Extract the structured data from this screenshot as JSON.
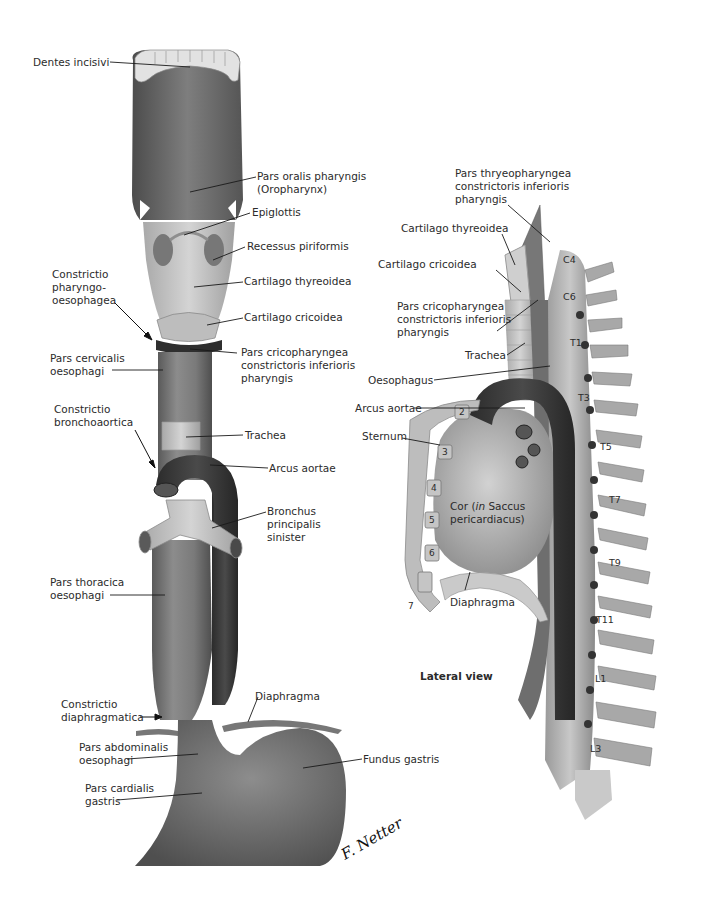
{
  "figure": {
    "type": "anatomical-illustration",
    "colors": {
      "background": "#ffffff",
      "tissue_dark": "#4a4a4a",
      "tissue_mid": "#7a7a7a",
      "tissue_light": "#b8b8b8",
      "cartilage": "#cfcfcf",
      "label_text": "#2b2b2b",
      "leader_line": "#1a1a1a"
    }
  },
  "anterior_view": {
    "labels": {
      "dentes_incisivi": "Dentes incisivi",
      "pars_oralis_1": "Pars oralis pharyngis",
      "pars_oralis_2": "(Oropharynx)",
      "epiglottis": "Epiglottis",
      "recessus": "Recessus piriformis",
      "cart_thyreoidea": "Cartilago thyreoidea",
      "constrictio_po_1": "Constrictio",
      "constrictio_po_2": "pharyngo-",
      "constrictio_po_3": "oesophagea",
      "cart_cricoidea": "Cartilago cricoidea",
      "pars_cervicalis_1": "Pars cervicalis",
      "pars_cervicalis_2": "oesophagi",
      "pars_cricoph_1": "Pars cricopharyngea",
      "pars_cricoph_2": "constrictoris inferioris",
      "pars_cricoph_3": "pharyngis",
      "constrictio_ba_1": "Constrictio",
      "constrictio_ba_2": "bronchoaortica",
      "trachea": "Trachea",
      "arcus_aortae": "Arcus aortae",
      "bronchus_1": "Bronchus",
      "bronchus_2": "principalis",
      "bronchus_3": "sinister",
      "pars_thoracica_1": "Pars thoracica",
      "pars_thoracica_2": "oesophagi",
      "constrictio_dia_1": "Constrictio",
      "constrictio_dia_2": "diaphragmatica",
      "diaphragma": "Diaphragma",
      "pars_abdominalis_1": "Pars abdominalis",
      "pars_abdominalis_2": "oesophagi",
      "pars_cardialis_1": "Pars cardialis",
      "pars_cardialis_2": "gastris",
      "fundus": "Fundus gastris"
    },
    "signature": "F. Netter M.D."
  },
  "lateral_view": {
    "title": "Lateral view",
    "labels": {
      "pars_thyreoph_1": "Pars thryeopharyngea",
      "pars_thyreoph_2": "constrictoris inferioris",
      "pars_thyreoph_3": "pharyngis",
      "cart_thyreoidea": "Cartilago thyreoidea",
      "cart_cricoidea": "Cartilago cricoidea",
      "pars_cricoph_1": "Pars cricopharyngea",
      "pars_cricoph_2": "constrictoris inferioris",
      "pars_cricoph_3": "pharyngis",
      "trachea": "Trachea",
      "oesophagus": "Oesophagus",
      "arcus_aortae": "Arcus aortae",
      "sternum": "Sternum",
      "cor_1a": "Cor (",
      "cor_1b": "in",
      "cor_1c": " Saccus",
      "cor_2": "pericardiacus)",
      "diaphragma": "Diaphragma"
    },
    "vertebrae": [
      "C4",
      "C6",
      "T1",
      "T3",
      "T5",
      "T7",
      "T9",
      "T11",
      "L1",
      "L3"
    ],
    "ribs": [
      "2",
      "3",
      "4",
      "5",
      "6",
      "7"
    ]
  }
}
